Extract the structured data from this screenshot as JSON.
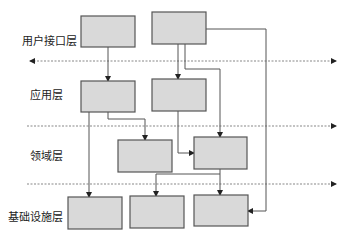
{
  "diagram": {
    "type": "layered-architecture",
    "layers": [
      {
        "id": "user-interface",
        "label": "用户接口层",
        "label_pos": [
          22,
          44
        ]
      },
      {
        "id": "application",
        "label": "应用层",
        "label_pos": [
          30,
          98
        ]
      },
      {
        "id": "domain",
        "label": "领域层",
        "label_pos": [
          30,
          159
        ]
      },
      {
        "id": "infrastructure",
        "label": "基础设施层",
        "label_pos": [
          8,
          220
        ]
      }
    ],
    "separators": [
      {
        "y": 61,
        "x1": 30,
        "x2": 336,
        "arrow_start": true,
        "arrow_end": true
      },
      {
        "y": 126,
        "x1": 27,
        "x2": 336,
        "arrow_start": false,
        "arrow_end": true
      },
      {
        "y": 184,
        "x1": 27,
        "x2": 336,
        "arrow_start": false,
        "arrow_end": true
      }
    ],
    "boxes": [
      {
        "id": "ui-1",
        "layer": "user-interface",
        "x": 81,
        "y": 16,
        "w": 54,
        "h": 31
      },
      {
        "id": "ui-2",
        "layer": "user-interface",
        "x": 152,
        "y": 12,
        "w": 54,
        "h": 32
      },
      {
        "id": "app-1",
        "layer": "application",
        "x": 81,
        "y": 81,
        "w": 54,
        "h": 31
      },
      {
        "id": "app-2",
        "layer": "application",
        "x": 152,
        "y": 79,
        "w": 54,
        "h": 32
      },
      {
        "id": "dom-1",
        "layer": "domain",
        "x": 118,
        "y": 140,
        "w": 54,
        "h": 32
      },
      {
        "id": "dom-2",
        "layer": "domain",
        "x": 194,
        "y": 137,
        "w": 53,
        "h": 32
      },
      {
        "id": "infra-1",
        "layer": "infrastructure",
        "x": 68,
        "y": 197,
        "w": 54,
        "h": 32
      },
      {
        "id": "infra-2",
        "layer": "infrastructure",
        "x": 130,
        "y": 196,
        "w": 54,
        "h": 32
      },
      {
        "id": "infra-3",
        "layer": "infrastructure",
        "x": 194,
        "y": 195,
        "w": 54,
        "h": 31
      }
    ],
    "connectors": [
      {
        "from": "ui-1",
        "to": "app-1",
        "points": [
          [
            108,
            47
          ],
          [
            108,
            81
          ]
        ]
      },
      {
        "from": "ui-2",
        "to": "app-2",
        "points": [
          [
            178,
            44
          ],
          [
            178,
            79
          ]
        ]
      },
      {
        "from": "ui-2",
        "to": "dom-2",
        "points": [
          [
            185,
            44
          ],
          [
            185,
            69
          ],
          [
            220,
            69
          ],
          [
            220,
            137
          ]
        ]
      },
      {
        "from": "ui-2",
        "to": "infra-3",
        "points": [
          [
            206,
            29
          ],
          [
            266,
            29
          ],
          [
            266,
            211
          ],
          [
            248,
            211
          ]
        ]
      },
      {
        "from": "app-1",
        "to": "infra-1",
        "points": [
          [
            89,
            112
          ],
          [
            89,
            197
          ]
        ]
      },
      {
        "from": "app-1",
        "to": "dom-1",
        "points": [
          [
            108,
            112
          ],
          [
            108,
            119
          ],
          [
            145,
            119
          ],
          [
            145,
            140
          ]
        ]
      },
      {
        "from": "app-2",
        "to": "dom-2",
        "points": [
          [
            178,
            111
          ],
          [
            178,
            153
          ],
          [
            194,
            153
          ]
        ]
      },
      {
        "from": "dom-2",
        "to": "infra-3",
        "points": [
          [
            220,
            169
          ],
          [
            220,
            195
          ]
        ]
      },
      {
        "from": "dom-2",
        "to": "infra-2",
        "points": [
          [
            220,
            174
          ],
          [
            156,
            174
          ],
          [
            156,
            196
          ]
        ]
      }
    ],
    "colors": {
      "box_fill": "#d9d9d9",
      "box_stroke": "#555555",
      "line": "#555555",
      "dashed": "#888888",
      "arrow": "#222222"
    }
  }
}
